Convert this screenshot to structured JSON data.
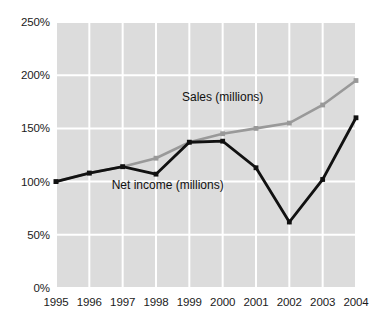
{
  "chart_data": {
    "type": "line",
    "title": "",
    "subtitle": "",
    "xlabel": "",
    "ylabel": "",
    "categories": [
      "1995",
      "1996",
      "1997",
      "1998",
      "1999",
      "2000",
      "2001",
      "2002",
      "2003",
      "2004"
    ],
    "x": [
      1995,
      1996,
      1997,
      1998,
      1999,
      2000,
      2001,
      2002,
      2003,
      2004
    ],
    "ylim": [
      0,
      250
    ],
    "xlim": [
      1995,
      2004
    ],
    "y_tick_labels": [
      "0%",
      "50%",
      "100%",
      "150%",
      "200%",
      "250%"
    ],
    "y_tick_values": [
      0,
      50,
      100,
      150,
      200,
      250
    ],
    "grid": true,
    "grid_color": "#ffffff",
    "plot_background": "#dcdcdc",
    "legend_position": "inline-annotations",
    "series": [
      {
        "name": "Sales (millions)",
        "label": "Sales (millions)",
        "color": "#999999",
        "marker": "square",
        "values": [
          100,
          108,
          114,
          122,
          137,
          145,
          150,
          155,
          172,
          195
        ]
      },
      {
        "name": "Net income (millions)",
        "label": "Net income (millions)",
        "color": "#111111",
        "marker": "square",
        "values": [
          100,
          108,
          114,
          107,
          137,
          138,
          113,
          62,
          102,
          160
        ]
      }
    ],
    "annotations": [
      {
        "text": "Sales (millions)",
        "x": 2000.0,
        "y": 176,
        "anchor": "middle",
        "series": "Sales (millions)"
      },
      {
        "text": "Net income (millions)",
        "x": 1998.35,
        "y": 93,
        "anchor": "middle",
        "series": "Net income (millions)"
      }
    ]
  },
  "axis": {
    "y_labels": [
      "250%",
      "200%",
      "150%",
      "100%",
      "50%",
      "0%"
    ],
    "x_labels": [
      "1995",
      "1996",
      "1997",
      "1998",
      "1999",
      "2000",
      "2001",
      "2002",
      "2003",
      "2004"
    ]
  },
  "labels": {
    "sales": "Sales (millions)",
    "net_income": "Net income (millions)"
  },
  "colors": {
    "sales_line": "#9a9a9a",
    "net_income_line": "#131313",
    "plot_bg": "#dcdcdc",
    "gridline": "#ffffff",
    "text": "#1b1b1b"
  }
}
